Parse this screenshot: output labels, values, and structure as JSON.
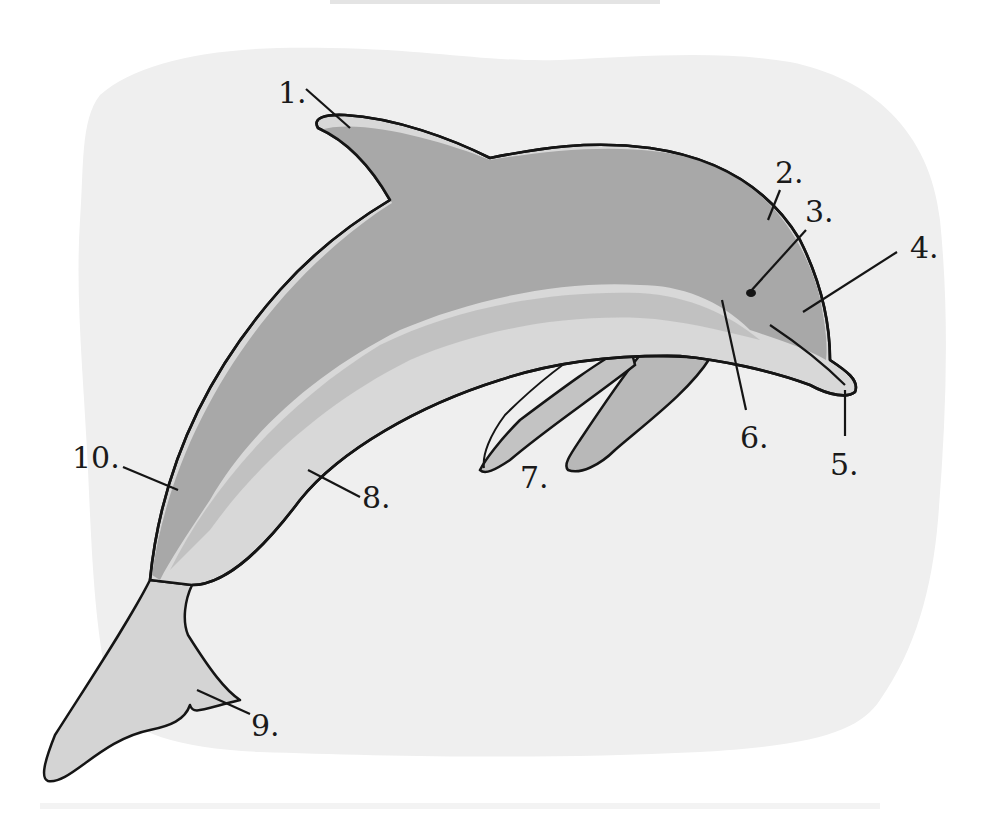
{
  "diagram": {
    "style": "hand-drawn grayscale illustration with numbered callouts",
    "colors": {
      "page_background": "#ffffff",
      "panel_background": "#efefef",
      "body_dark": "#a9a9a9",
      "body_mid": "#b9b9b9",
      "belly_light": "#d6d6d6",
      "outline": "#151515",
      "label_text": "#1a1a1a"
    },
    "callouts": [
      {
        "number": "1.",
        "text": "1.",
        "points_to": "dorsal fin"
      },
      {
        "number": "2.",
        "text": "2.",
        "points_to": "melon / forehead"
      },
      {
        "number": "3.",
        "text": "3.",
        "points_to": "eye"
      },
      {
        "number": "4.",
        "text": "4.",
        "points_to": "upper jaw / head"
      },
      {
        "number": "5.",
        "text": "5.",
        "points_to": "rostrum / beak tip"
      },
      {
        "number": "6.",
        "text": "6.",
        "points_to": "throat / mouth line"
      },
      {
        "number": "7.",
        "text": "7.",
        "points_to": "pectoral flippers"
      },
      {
        "number": "8.",
        "text": "8.",
        "points_to": "belly"
      },
      {
        "number": "9.",
        "text": "9.",
        "points_to": "tail fluke"
      },
      {
        "number": "10.",
        "text": "10.",
        "points_to": "peduncle / tail stock"
      }
    ]
  }
}
